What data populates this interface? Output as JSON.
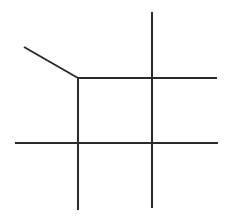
{
  "canvas": {
    "width": 229,
    "height": 221,
    "background_color": "#ffffff",
    "title": "line-drawing"
  },
  "style": {
    "stroke_color": "#2a2a2c",
    "stroke_width": 2,
    "stroke_linecap": "butt"
  },
  "figure": {
    "segment_count": 5,
    "segments": [
      {
        "name": "oblique-segment",
        "orientation": "diagonal",
        "x1": 24,
        "y1": 47,
        "x2": 78,
        "y2": 78
      },
      {
        "name": "upper-horizontal-segment",
        "orientation": "horizontal",
        "x1": 78,
        "y1": 78,
        "x2": 217,
        "y2": 78
      },
      {
        "name": "lower-horizontal-segment",
        "orientation": "horizontal",
        "x1": 15,
        "y1": 143,
        "x2": 218,
        "y2": 143
      },
      {
        "name": "left-vertical-segment",
        "orientation": "vertical",
        "x1": 78,
        "y1": 77,
        "x2": 78,
        "y2": 210
      },
      {
        "name": "right-vertical-segment",
        "orientation": "vertical",
        "x1": 152,
        "y1": 12,
        "x2": 152,
        "y2": 208
      }
    ],
    "junctions": [
      {
        "name": "corner-junction-upper-left",
        "x": 78,
        "y": 78,
        "type": "three-way"
      },
      {
        "name": "crossing-upper-right",
        "x": 152,
        "y": 78,
        "type": "crossing"
      },
      {
        "name": "crossing-lower-left",
        "x": 78,
        "y": 143,
        "type": "crossing"
      },
      {
        "name": "crossing-lower-right",
        "x": 152,
        "y": 143,
        "type": "crossing"
      }
    ]
  }
}
